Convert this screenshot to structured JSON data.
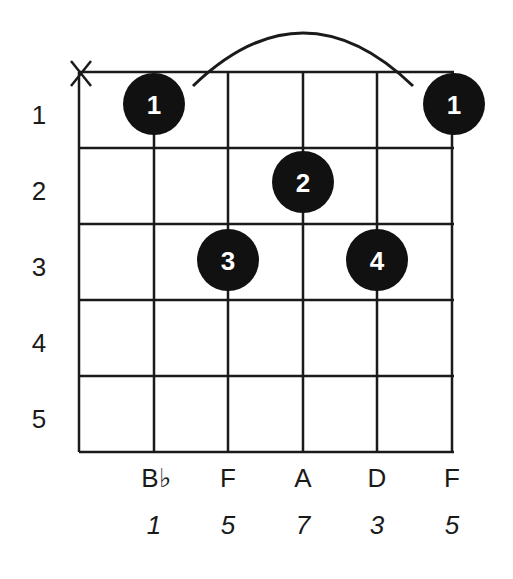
{
  "chord": {
    "muted_string_marker": "X",
    "fret_numbers": [
      "1",
      "2",
      "3",
      "4",
      "5"
    ],
    "note_names": [
      "B♭",
      "F",
      "A",
      "D",
      "F"
    ],
    "intervals": [
      "1",
      "5",
      "7",
      "3",
      "5"
    ],
    "fingers": [
      {
        "string": 2,
        "fret": 1,
        "finger": "1"
      },
      {
        "string": 6,
        "fret": 1,
        "finger": "1"
      },
      {
        "string": 4,
        "fret": 2,
        "finger": "2"
      },
      {
        "string": 3,
        "fret": 3,
        "finger": "3"
      },
      {
        "string": 5,
        "fret": 3,
        "finger": "4"
      }
    ],
    "barre": {
      "from_string": 2,
      "to_string": 6,
      "fret": 1
    }
  }
}
